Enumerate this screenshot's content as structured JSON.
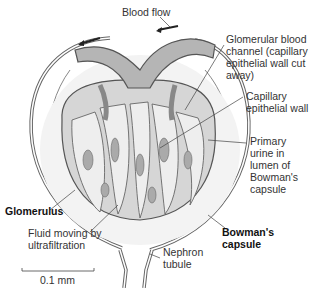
{
  "diagram": {
    "labels": {
      "blood_flow": "Blood flow",
      "glomerular_channel": "Glomerular blood\nchannel (capillary\nepithelial wall cut\naway)",
      "capillary_wall": "Capillary\nepithelial wall",
      "primary_urine": "Primary\nurine in\nlumen of\nBowman's\ncapsule",
      "glomerulus": "Glomerulus",
      "fluid": "Fluid moving by\nultrafiltration",
      "bowmans_capsule": "Bowman's\ncapsule",
      "nephron_tubule": "Nephron\ntubule",
      "scale": "0.1 mm"
    },
    "colors": {
      "tissue_dark": "#9a9a9a",
      "tissue_mid": "#c4c4c4",
      "tissue_light": "#e6e6e6",
      "outline": "#555555"
    }
  }
}
